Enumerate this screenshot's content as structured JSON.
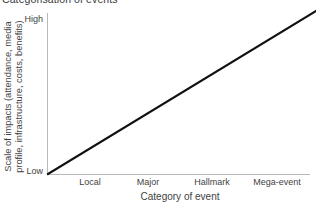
{
  "chart": {
    "title": "Categorisation of events",
    "background_color": "#ffffff",
    "axis_color": "#b9b9b9",
    "series_color": "#111111",
    "text_color": "#3f3f3f"
  },
  "chart_data": {
    "type": "line",
    "title": "Categorisation of events",
    "subtitle": "",
    "xlabel": "Category of event",
    "ylabel": "Scale of impacts (attendance, media profile, infrastructure, costs, benefits)",
    "ylabel_line1": "Scale of impacts (attendance, media",
    "ylabel_line2": "profile, infrastructure, costs, benefits)",
    "categories": [
      "Local",
      "Major",
      "Hallmark",
      "Mega-event"
    ],
    "x": [
      1,
      2,
      3,
      4
    ],
    "series": [
      {
        "name": "Scale of impacts",
        "values": [
          1.3,
          2.1,
          2.9,
          3.8
        ],
        "color": "#111111",
        "style": "solid",
        "width": 2
      }
    ],
    "ytick_labels": [
      "Low",
      "High"
    ],
    "ytick_values": [
      0,
      1
    ],
    "ylim": [
      0,
      1
    ],
    "xlim": [
      0.5,
      4.5
    ],
    "grid": false,
    "legend": false,
    "legend_position": "none",
    "annotations": []
  },
  "y_axis": {
    "title_line1": "Scale of impacts (attendance, media",
    "title_line2": "profile, infrastructure, costs, benefits)",
    "tick_high": "High",
    "tick_low": "Low"
  },
  "x_axis": {
    "title": "Category of event",
    "ticks": [
      {
        "label": "Local",
        "center_px": 90
      },
      {
        "label": "Major",
        "center_px": 148
      },
      {
        "label": "Hallmark",
        "center_px": 212
      },
      {
        "label": "Mega-event",
        "center_px": 277
      }
    ]
  }
}
